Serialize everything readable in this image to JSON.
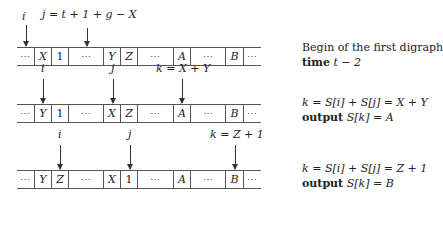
{
  "panels": [
    {
      "cells": [
        "⋯",
        "X",
        "1",
        "⋯",
        "Y",
        "Z",
        "⋯",
        "A",
        "⋯",
        "B",
        "⋯"
      ],
      "pointers": [
        {
          "label": "i",
          "cell_index": 0
        },
        {
          "label": "j = t + 1 + g − X",
          "cell_index": 3
        }
      ],
      "description": {
        "line1": "Begin of the first digraph",
        "line2_keyword": "time",
        "line2_expr": "t − 2"
      }
    },
    {
      "cells": [
        "⋯",
        "Y",
        "1",
        "⋯",
        "X",
        "Z",
        "⋯",
        "A",
        "⋯",
        "B",
        "⋯"
      ],
      "pointers": [
        {
          "label": "i",
          "cell_index": 1
        },
        {
          "label": "j",
          "cell_index": 4
        },
        {
          "label": "k = X + Y",
          "cell_index": 7
        }
      ],
      "description": {
        "line1": "k = S[i] + S[j] = X + Y",
        "line2_keyword": "output",
        "line2_expr": "S[k] = A"
      }
    },
    {
      "cells": [
        "⋯",
        "Y",
        "Z",
        "⋯",
        "X",
        "1",
        "⋯",
        "A",
        "⋯",
        "B",
        "⋯"
      ],
      "pointers": [
        {
          "label": "i",
          "cell_index": 2
        },
        {
          "label": "j",
          "cell_index": 5
        },
        {
          "label": "k = Z + 1",
          "cell_index": 9
        }
      ],
      "description": {
        "line1": "k = S[i] + S[j] = Z + 1",
        "line2_keyword": "output",
        "line2_expr": "S[k] = B"
      }
    }
  ]
}
